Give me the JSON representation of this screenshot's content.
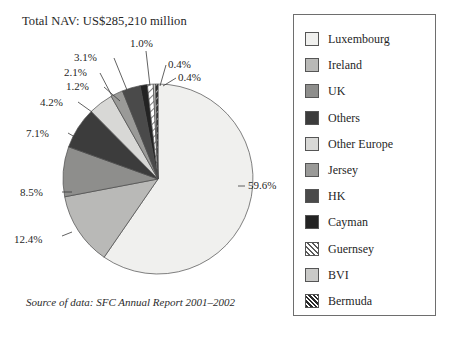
{
  "title": "Total NAV: US$285,210 million",
  "source_note": "Source of data: SFC Annual Report 2001–2002",
  "legend": {
    "items": [
      {
        "label": "Luxembourg",
        "color": "#f0f0ee",
        "pattern": "solid"
      },
      {
        "label": "Ireland",
        "color": "#b9b9b7",
        "pattern": "solid"
      },
      {
        "label": "UK",
        "color": "#8e8e8c",
        "pattern": "solid"
      },
      {
        "label": "Others",
        "color": "#3c3c3c",
        "pattern": "solid"
      },
      {
        "label": "Other Europe",
        "color": "#d8d8d6",
        "pattern": "solid"
      },
      {
        "label": "Jersey",
        "color": "#9a9a98",
        "pattern": "solid"
      },
      {
        "label": "HK",
        "color": "#4a4a4a",
        "pattern": "solid"
      },
      {
        "label": "Cayman",
        "color": "#232323",
        "pattern": "solid"
      },
      {
        "label": "Guernsey",
        "color": "#ffffff",
        "pattern": "hatch-light"
      },
      {
        "label": "BVI",
        "color": "#c9c9c7",
        "pattern": "solid"
      },
      {
        "label": "Bermuda",
        "color": "#2a2a2a",
        "pattern": "hatch-dark"
      }
    ]
  },
  "chart_data": {
    "type": "pie",
    "title": "Total NAV: US$285,210 million",
    "total_label": "US$285,210 million",
    "units": "percent",
    "legend_position": "right",
    "categories": [
      "Luxembourg",
      "Ireland",
      "UK",
      "Others",
      "Other Europe",
      "Jersey",
      "HK",
      "Cayman",
      "Guernsey",
      "BVI",
      "Bermuda"
    ],
    "values": [
      59.6,
      12.4,
      8.5,
      7.1,
      4.2,
      2.1,
      3.1,
      1.2,
      1.0,
      0.4,
      0.4
    ],
    "value_labels": [
      "59.6%",
      "12.4%",
      "8.5%",
      "7.1%",
      "4.2%",
      "2.1%",
      "3.1%",
      "1.2%",
      "1.0%",
      "0.4%",
      "0.4%"
    ],
    "colors": [
      "#f0f0ee",
      "#b9b9b7",
      "#8e8e8c",
      "#3c3c3c",
      "#d8d8d6",
      "#9a9a98",
      "#4a4a4a",
      "#232323",
      "#ffffff",
      "#c9c9c7",
      "#2a2a2a"
    ],
    "start_angle_deg": 0,
    "direction": "clockwise",
    "source": "SFC Annual Report 2001–2002"
  }
}
